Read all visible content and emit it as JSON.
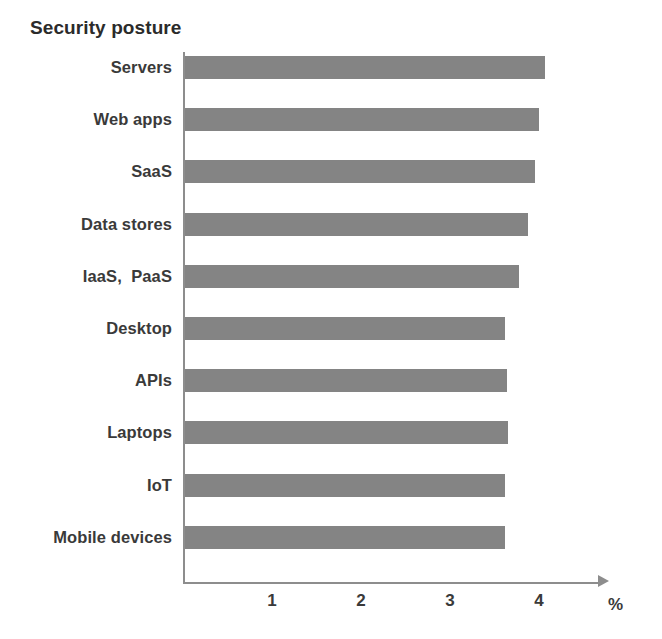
{
  "chart_data": {
    "type": "bar",
    "orientation": "horizontal",
    "title": "Security posture",
    "xlabel": "%",
    "ylabel": "",
    "categories": [
      "Servers",
      "Web apps",
      "SaaS",
      "Data stores",
      "IaaS,  PaaS",
      "Desktop",
      "APIs",
      "Laptops",
      "IoT",
      "Mobile devices"
    ],
    "values": [
      4.05,
      3.98,
      3.93,
      3.85,
      3.75,
      3.6,
      3.62,
      3.63,
      3.6,
      3.6
    ],
    "xlim": [
      0,
      4.8
    ],
    "xticks": [
      1,
      2,
      3,
      4
    ],
    "xtick_labels": [
      "1",
      "2",
      "3",
      "4"
    ],
    "grid": false,
    "legend": false,
    "bar_color": "#848484",
    "axis_color": "#8d8d8d",
    "text_color": "#3a3a3a"
  }
}
